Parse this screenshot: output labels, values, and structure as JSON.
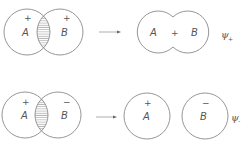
{
  "diagram": {
    "colors": {
      "line": "#8a8a8a",
      "text": "#555555",
      "background": "#ffffff"
    },
    "rows": [
      {
        "name": "bonding",
        "before": {
          "atoms": [
            {
              "label": "A",
              "sign": "+"
            },
            {
              "label": "B",
              "sign": "+"
            }
          ],
          "overlap": "hatched"
        },
        "arrow": "right-arrow",
        "after": {
          "shape": "merged",
          "text_left": "A",
          "text_mid": "+",
          "text_right": "B"
        },
        "psi": {
          "symbol": "ψ",
          "subscript": "+"
        }
      },
      {
        "name": "antibonding",
        "before": {
          "atoms": [
            {
              "label": "A",
              "sign": "+"
            },
            {
              "label": "B",
              "sign": "−"
            }
          ],
          "overlap": "hatched"
        },
        "arrow": "right-arrow",
        "after": {
          "shape": "separate",
          "atoms": [
            {
              "label": "A",
              "sign": "+"
            },
            {
              "label": "B",
              "sign": "−"
            }
          ]
        },
        "psi": {
          "symbol": "ψ",
          "subscript": "-"
        }
      }
    ]
  }
}
